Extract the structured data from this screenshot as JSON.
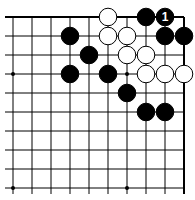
{
  "board": {
    "cols": 10,
    "rows": 10,
    "origin_x": 13,
    "origin_y": 17,
    "spacing": 19,
    "open_edges": [
      "left",
      "bottom"
    ],
    "star_points": [
      [
        0,
        3
      ],
      [
        6,
        3
      ],
      [
        0,
        9
      ],
      [
        6,
        9
      ]
    ],
    "stones": [
      {
        "c": 5,
        "r": 0,
        "color": "white"
      },
      {
        "c": 7,
        "r": 0,
        "color": "black"
      },
      {
        "c": 8,
        "r": 0,
        "color": "black",
        "label": "1"
      },
      {
        "c": 3,
        "r": 1,
        "color": "black"
      },
      {
        "c": 5,
        "r": 1,
        "color": "white"
      },
      {
        "c": 6,
        "r": 1,
        "color": "white"
      },
      {
        "c": 8,
        "r": 1,
        "color": "black"
      },
      {
        "c": 9,
        "r": 1,
        "color": "black"
      },
      {
        "c": 4,
        "r": 2,
        "color": "black"
      },
      {
        "c": 6,
        "r": 2,
        "color": "white"
      },
      {
        "c": 7,
        "r": 2,
        "color": "white"
      },
      {
        "c": 3,
        "r": 3,
        "color": "black"
      },
      {
        "c": 5,
        "r": 3,
        "color": "black"
      },
      {
        "c": 7,
        "r": 3,
        "color": "white"
      },
      {
        "c": 8,
        "r": 3,
        "color": "white"
      },
      {
        "c": 9,
        "r": 3,
        "color": "white"
      },
      {
        "c": 6,
        "r": 4,
        "color": "black"
      },
      {
        "c": 7,
        "r": 5,
        "color": "black"
      },
      {
        "c": 8,
        "r": 5,
        "color": "black"
      }
    ]
  }
}
